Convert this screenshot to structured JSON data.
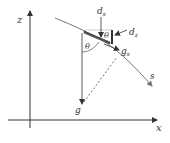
{
  "diagram": {
    "labels": {
      "z_axis": "z",
      "x_axis": "x",
      "s_curve": "s",
      "d_s": "d",
      "d_s_sub": "s",
      "d_z": "d",
      "d_z_sub": "z",
      "theta_top": "θ",
      "theta_left": "θ",
      "g": "g",
      "g_s": "g",
      "g_s_sub": "s"
    },
    "colors": {
      "line": "#333333",
      "curve": "#666666",
      "plate": "#444444"
    }
  }
}
